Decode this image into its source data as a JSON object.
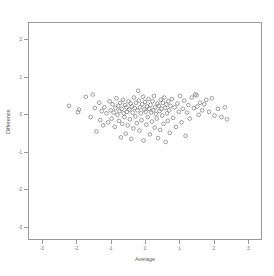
{
  "chart_data": {
    "type": "scatter",
    "title": "",
    "xlabel": "Average",
    "ylabel": "Difference",
    "xlim": [
      -3.4,
      3.4
    ],
    "ylim": [
      -3.35,
      2.45
    ],
    "xticks": [
      -3,
      -2,
      -1,
      0,
      1,
      2,
      3
    ],
    "xticklabels": [
      "-3",
      "-2",
      "-1",
      "0",
      "1",
      "2",
      "3"
    ],
    "yticks": [
      -3,
      -2,
      -1,
      0,
      1,
      2
    ],
    "yticklabels": [
      "-3",
      "-2",
      "-1",
      "0",
      "1",
      "2"
    ],
    "grid": false,
    "legend": null,
    "marker": "open-circle",
    "marker_color": "#7d7d7d",
    "n_points": 132,
    "x": [
      -2.21,
      -1.95,
      -1.92,
      -1.58,
      -1.52,
      -1.41,
      -1.33,
      -1.3,
      -1.26,
      -1.22,
      -1.18,
      -1.12,
      -1.07,
      -1.03,
      -1.0,
      -0.97,
      -0.94,
      -0.91,
      -0.88,
      -0.86,
      -0.83,
      -0.8,
      -0.78,
      -0.76,
      -0.74,
      -0.72,
      -0.7,
      -0.68,
      -0.66,
      -0.64,
      -0.62,
      -0.6,
      -0.58,
      -0.56,
      -0.54,
      -0.52,
      -0.5,
      -0.48,
      -0.46,
      -0.44,
      -0.42,
      -0.4,
      -0.38,
      -0.36,
      -0.34,
      -0.32,
      -0.3,
      -0.28,
      -0.26,
      -0.24,
      -0.22,
      -0.2,
      -0.18,
      -0.16,
      -0.14,
      -0.12,
      -0.1,
      -0.08,
      -0.06,
      -0.04,
      -0.02,
      0.0,
      0.02,
      0.04,
      0.06,
      0.08,
      0.1,
      0.12,
      0.14,
      0.16,
      0.18,
      0.2,
      0.22,
      0.24,
      0.26,
      0.28,
      0.3,
      0.32,
      0.34,
      0.36,
      0.38,
      0.4,
      0.42,
      0.44,
      0.46,
      0.48,
      0.5,
      0.52,
      0.54,
      0.56,
      0.58,
      0.6,
      0.62,
      0.64,
      0.66,
      0.68,
      0.7,
      0.72,
      0.74,
      0.78,
      0.82,
      0.86,
      0.9,
      0.94,
      0.98,
      1.02,
      1.06,
      1.1,
      1.14,
      1.18,
      1.22,
      1.26,
      1.3,
      1.36,
      1.42,
      1.46,
      1.5,
      1.52,
      1.56,
      1.6,
      1.66,
      1.72,
      1.78,
      1.86,
      1.94,
      2.02,
      2.12,
      2.22,
      2.32,
      2.38,
      -1.72,
      -1.46
    ],
    "y": [
      0.22,
      0.05,
      0.12,
      -0.08,
      0.52,
      -0.46,
      0.3,
      -0.16,
      0.08,
      -0.3,
      0.18,
      0.02,
      -0.22,
      0.34,
      0.1,
      -0.12,
      0.26,
      0.04,
      -0.34,
      0.16,
      0.42,
      -0.02,
      0.22,
      -0.18,
      0.08,
      0.3,
      -0.62,
      0.14,
      -0.26,
      0.38,
      0.02,
      -0.08,
      0.24,
      -0.52,
      0.18,
      0.06,
      -0.3,
      0.34,
      0.12,
      -0.14,
      0.28,
      -0.66,
      0.2,
      0.04,
      -0.38,
      0.44,
      0.16,
      -0.06,
      0.3,
      -0.24,
      0.1,
      0.62,
      0.36,
      -0.44,
      0.18,
      0.02,
      -0.16,
      0.26,
      0.46,
      -0.7,
      0.12,
      0.32,
      0.06,
      -0.28,
      0.2,
      -0.08,
      0.4,
      0.14,
      -0.54,
      0.24,
      0.04,
      -0.2,
      0.34,
      0.1,
      0.48,
      -0.36,
      0.18,
      0.0,
      -0.12,
      0.28,
      -0.64,
      0.22,
      0.08,
      -0.42,
      0.38,
      0.14,
      -0.04,
      0.3,
      -0.26,
      0.44,
      0.16,
      -0.74,
      0.26,
      0.02,
      -0.18,
      0.34,
      0.1,
      -0.5,
      0.22,
      0.4,
      -0.1,
      0.18,
      -0.34,
      0.28,
      0.06,
      0.48,
      -0.22,
      0.14,
      0.36,
      -0.58,
      0.04,
      0.24,
      -0.12,
      0.44,
      0.16,
      0.52,
      0.5,
      0.2,
      -0.02,
      0.3,
      0.1,
      0.26,
      0.38,
      0.06,
      0.42,
      -0.04,
      0.14,
      -0.08,
      0.18,
      -0.14,
      0.46,
      0.16
    ]
  },
  "axes": {
    "x_axis_name": "Average",
    "y_axis_name": "Difference"
  }
}
